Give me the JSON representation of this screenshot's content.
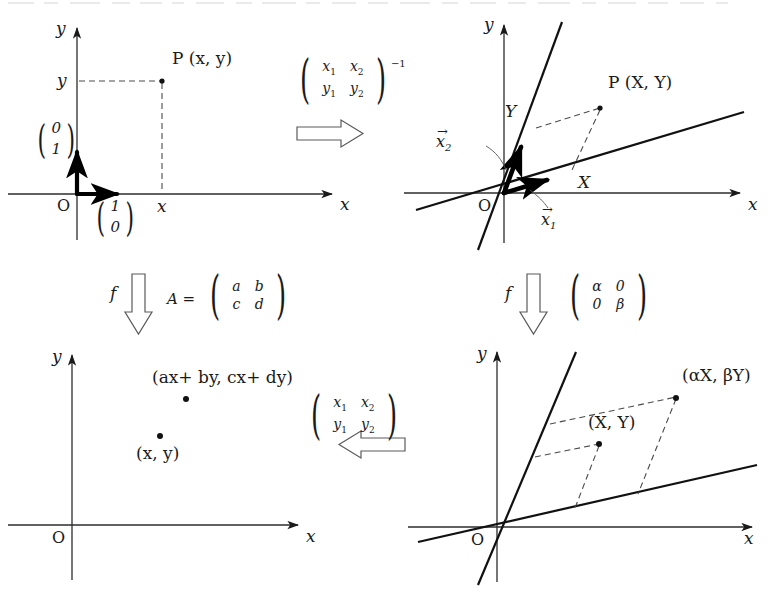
{
  "figure": {
    "type": "diagram",
    "background": "#ffffff",
    "ink": "#1a1a1a"
  },
  "panels": {
    "top_left": {
      "name": "standard-basis-plane",
      "axis_x_label": "x",
      "axis_y_label": "y",
      "origin_label": "O",
      "point_label": "P (x, y)",
      "tick_x_label": "x",
      "tick_y_label": "y",
      "basis_vector_1": {
        "top": "1",
        "bottom": "0"
      },
      "basis_vector_2": {
        "top": "0",
        "bottom": "1"
      }
    },
    "top_right": {
      "name": "oblique-basis-plane",
      "axis_x_label": "x",
      "axis_y_label": "y",
      "origin_label": "O",
      "point_label": "P (X, Y)",
      "coord_X_label": "X",
      "coord_Y_label": "Y",
      "vector_1_label": "x",
      "vector_1_sub": "1",
      "vector_2_label": "x",
      "vector_2_sub": "2"
    },
    "bottom_left": {
      "name": "image-points-plane",
      "axis_x_label": "x",
      "axis_y_label": "y",
      "origin_label": "O",
      "point_source_label": "(x, y)",
      "point_image_label": "(ax+ by, cx+ dy)"
    },
    "bottom_right": {
      "name": "scaled-oblique-plane",
      "axis_x_label": "x",
      "axis_y_label": "y",
      "origin_label": "O",
      "point_source_label": "(X, Y)",
      "point_image_label": "(αX, βY)"
    }
  },
  "arrows": {
    "top_center": {
      "name": "change-of-basis-inverse",
      "direction": "right",
      "matrix": {
        "r1c1": "x",
        "r1c1_sub": "1",
        "r1c2": "x",
        "r1c2_sub": "2",
        "r2c1": "y",
        "r2c1_sub": "1",
        "r2c2": "y",
        "r2c2_sub": "2"
      },
      "exponent": "−1"
    },
    "bottom_center": {
      "name": "change-of-basis",
      "direction": "left",
      "matrix": {
        "r1c1": "x",
        "r1c1_sub": "1",
        "r1c2": "x",
        "r1c2_sub": "2",
        "r2c1": "y",
        "r2c1_sub": "1",
        "r2c2": "y",
        "r2c2_sub": "2"
      }
    },
    "middle_left": {
      "name": "map-f-standard",
      "direction": "down",
      "map_symbol": "f",
      "matrix_name": "A =",
      "matrix": {
        "r1c1": "a",
        "r1c2": "b",
        "r2c1": "c",
        "r2c2": "d"
      }
    },
    "middle_right": {
      "name": "map-f-diagonal",
      "direction": "down",
      "map_symbol": "f",
      "matrix": {
        "r1c1": "α",
        "r1c2": "0",
        "r2c1": "0",
        "r2c2": "β"
      }
    }
  }
}
